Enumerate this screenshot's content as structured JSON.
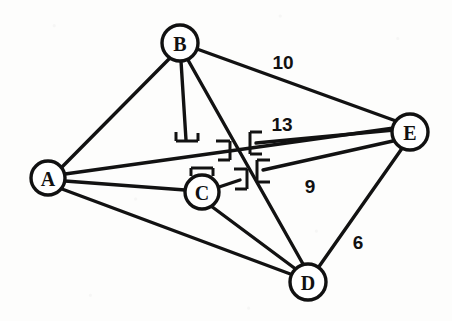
{
  "diagram": {
    "type": "node-link-graph",
    "canvas": {
      "width": 452,
      "height": 321
    },
    "style": {
      "background_color": "#fdfdfc",
      "stroke_color": "#121212",
      "node_fill_color": "#ffffff",
      "node_radius": 17
    },
    "nodes": [
      {
        "id": "A",
        "label": "A",
        "x": 48,
        "y": 178,
        "r": 17
      },
      {
        "id": "B",
        "label": "B",
        "x": 180,
        "y": 43,
        "r": 18
      },
      {
        "id": "C",
        "label": "C",
        "x": 202,
        "y": 192,
        "r": 17
      },
      {
        "id": "D",
        "label": "D",
        "x": 308,
        "y": 282,
        "r": 18
      },
      {
        "id": "E",
        "label": "E",
        "x": 410,
        "y": 132,
        "r": 18
      }
    ],
    "edges": [
      {
        "id": "edge-a-b",
        "from": "A",
        "to": "B",
        "weight": null
      },
      {
        "id": "edge-a-c",
        "from": "A",
        "to": "C",
        "weight": null
      },
      {
        "id": "edge-a-d",
        "from": "A",
        "to": "D",
        "weight": null
      },
      {
        "id": "edge-a-e",
        "from": "A",
        "to": "E",
        "weight": null
      },
      {
        "id": "edge-b-e",
        "from": "B",
        "to": "E",
        "weight": "10"
      },
      {
        "id": "edge-b-d",
        "from": "B",
        "to": "D",
        "weight": null
      },
      {
        "id": "edge-b-c",
        "from": "B",
        "to": "C",
        "weight": null
      },
      {
        "id": "edge-c-e",
        "from": "C",
        "to": "E",
        "weight": "13"
      },
      {
        "id": "edge-c-d",
        "from": "C",
        "to": "D",
        "weight": null
      },
      {
        "id": "edge-d-e",
        "from": "D",
        "to": "E",
        "weight": "6"
      },
      {
        "id": "edge-c-e-lower",
        "from": "C",
        "to": "E",
        "weight": "9"
      }
    ],
    "weight_labels": [
      {
        "id": "weight-10",
        "text": "10",
        "x": 283,
        "y": 62,
        "edge": "edge-b-e"
      },
      {
        "id": "weight-13",
        "text": "13",
        "x": 282,
        "y": 124,
        "edge": "edge-c-e"
      },
      {
        "id": "weight-9",
        "text": "9",
        "x": 310,
        "y": 186,
        "edge": "edge-c-e-lower"
      },
      {
        "id": "weight-6",
        "text": "6",
        "x": 358,
        "y": 242,
        "edge": "edge-d-e"
      }
    ],
    "markers": [
      {
        "id": "marker-bc-end",
        "kind": "perpendicular-tee",
        "x": 186,
        "y": 140,
        "orientation": "down"
      },
      {
        "id": "marker-ae-right",
        "kind": "right-bracket",
        "x": 224,
        "y": 150,
        "orientation": "right"
      },
      {
        "id": "marker-c-top",
        "kind": "perpendicular-tee",
        "x": 202,
        "y": 170,
        "orientation": "up"
      },
      {
        "id": "marker-c-right",
        "kind": "right-bracket",
        "x": 241,
        "y": 179,
        "orientation": "right"
      },
      {
        "id": "marker-ce-left",
        "kind": "left-bracket",
        "x": 252,
        "y": 143,
        "orientation": "left"
      },
      {
        "id": "marker-ce9-left",
        "kind": "left-bracket",
        "x": 259,
        "y": 171,
        "orientation": "left"
      }
    ]
  }
}
